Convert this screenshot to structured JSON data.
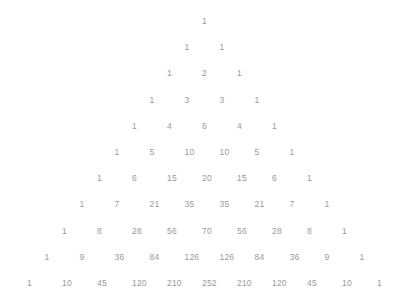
{
  "figure": {
    "background_color": "#ffffff",
    "text_color": "#9a9a9a"
  },
  "chart_data": {
    "type": "table",
    "subtitle": "",
    "xlabel": "",
    "ylabel": "",
    "layout": {
      "arrangement": "centered-pyramid",
      "rows": 11,
      "row_spacing_px": 26.2,
      "column_spacing_px": 35,
      "apex_x_px": 202,
      "apex_y_px": 21,
      "grid": false,
      "legend": "none",
      "axes": false
    },
    "rows": [
      {
        "n": 0,
        "values": [
          1
        ]
      },
      {
        "n": 1,
        "values": [
          1,
          1
        ]
      },
      {
        "n": 2,
        "values": [
          1,
          2,
          1
        ]
      },
      {
        "n": 3,
        "values": [
          1,
          3,
          3,
          1
        ]
      },
      {
        "n": 4,
        "values": [
          1,
          4,
          6,
          4,
          1
        ]
      },
      {
        "n": 5,
        "values": [
          1,
          5,
          10,
          10,
          5,
          1
        ]
      },
      {
        "n": 6,
        "values": [
          1,
          6,
          15,
          20,
          15,
          6,
          1
        ]
      },
      {
        "n": 7,
        "values": [
          1,
          7,
          21,
          35,
          35,
          21,
          7,
          1
        ]
      },
      {
        "n": 8,
        "values": [
          1,
          8,
          28,
          56,
          70,
          56,
          28,
          8,
          1
        ]
      },
      {
        "n": 9,
        "values": [
          1,
          9,
          36,
          84,
          126,
          126,
          84,
          36,
          9,
          1
        ]
      },
      {
        "n": 10,
        "values": [
          1,
          10,
          45,
          120,
          210,
          252,
          210,
          120,
          45,
          10,
          1
        ]
      }
    ]
  }
}
